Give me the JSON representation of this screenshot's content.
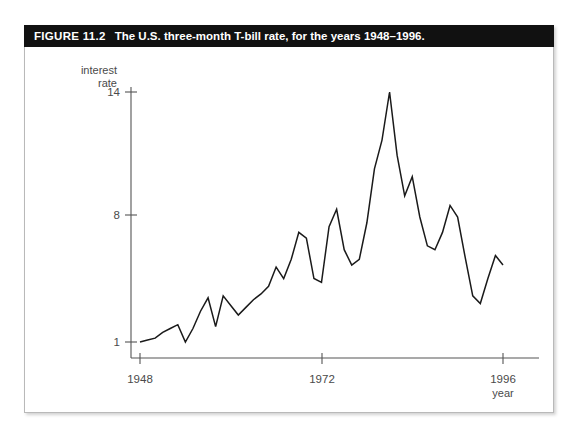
{
  "figure": {
    "label": "FIGURE 11.2",
    "caption": "The U.S. three-month T-bill rate, for the years 1948–1996."
  },
  "chart_data": {
    "type": "line",
    "title": "The U.S. three-month T-bill rate, for the years 1948–1996.",
    "xlabel": "year",
    "ylabel": "interest rate",
    "ylabel_line1": "interest",
    "ylabel_line2": "rate",
    "xlim": [
      1948,
      1996
    ],
    "ylim": [
      0.0,
      15.0
    ],
    "xticks": [
      1948,
      1972,
      1996
    ],
    "xtick_labels": [
      "1948",
      "1972",
      "1996"
    ],
    "yticks": [
      1,
      8,
      14
    ],
    "ytick_labels": [
      "1",
      "8",
      "14"
    ],
    "grid": false,
    "legend": null,
    "series_name": "three-month T-bill rate",
    "line_color": "#1a1a1a",
    "x": [
      1948,
      1949,
      1950,
      1951,
      1952,
      1953,
      1954,
      1955,
      1956,
      1957,
      1958,
      1959,
      1960,
      1961,
      1962,
      1963,
      1964,
      1965,
      1966,
      1967,
      1968,
      1969,
      1970,
      1971,
      1972,
      1973,
      1974,
      1975,
      1976,
      1977,
      1978,
      1979,
      1980,
      1981,
      1982,
      1983,
      1984,
      1985,
      1986,
      1987,
      1988,
      1989,
      1990,
      1991,
      1992,
      1993,
      1994,
      1995,
      1996
    ],
    "values": [
      1.0,
      1.1,
      1.2,
      1.5,
      1.7,
      1.9,
      1.0,
      1.7,
      2.6,
      3.3,
      1.8,
      3.4,
      2.9,
      2.4,
      2.8,
      3.2,
      3.5,
      3.9,
      4.9,
      4.3,
      5.3,
      6.7,
      6.4,
      4.3,
      4.1,
      7.0,
      7.9,
      5.8,
      5.0,
      5.3,
      7.2,
      10.0,
      11.5,
      14.0,
      10.7,
      8.6,
      9.6,
      7.5,
      6.0,
      5.8,
      6.7,
      8.1,
      7.5,
      5.4,
      3.4,
      3.0,
      4.3,
      5.5,
      5.0
    ]
  }
}
